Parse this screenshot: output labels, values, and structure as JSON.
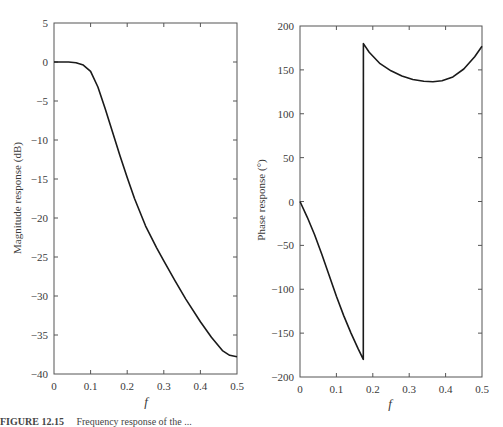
{
  "chart_data": [
    {
      "type": "line",
      "title": "",
      "xlabel": "f",
      "ylabel": "Magnitude response (dB)",
      "xlim": [
        0,
        0.5
      ],
      "ylim": [
        -40,
        5
      ],
      "xticks": [
        0,
        0.1,
        0.2,
        0.3,
        0.4,
        0.5
      ],
      "yticks": [
        5,
        0,
        -5,
        -10,
        -15,
        -20,
        -25,
        -30,
        -35,
        -40
      ],
      "grid": false,
      "legend": null,
      "series": [
        {
          "name": "magnitude",
          "x": [
            0,
            0.02,
            0.04,
            0.06,
            0.08,
            0.1,
            0.12,
            0.14,
            0.16,
            0.18,
            0.2,
            0.22,
            0.25,
            0.28,
            0.3,
            0.33,
            0.36,
            0.4,
            0.43,
            0.46,
            0.48,
            0.5
          ],
          "y": [
            0,
            0,
            0,
            -0.1,
            -0.4,
            -1.2,
            -3.2,
            -6.0,
            -9.0,
            -12.0,
            -14.8,
            -17.5,
            -21.0,
            -23.8,
            -25.5,
            -28.0,
            -30.4,
            -33.3,
            -35.3,
            -37.0,
            -37.6,
            -37.8
          ]
        }
      ]
    },
    {
      "type": "line",
      "title": "",
      "xlabel": "f",
      "ylabel": "Phase response (°)",
      "xlim": [
        0,
        0.5
      ],
      "ylim": [
        -200,
        200
      ],
      "xticks": [
        0,
        0.1,
        0.2,
        0.3,
        0.4,
        0.5
      ],
      "yticks": [
        200,
        150,
        100,
        50,
        0,
        -50,
        -100,
        -150,
        -200
      ],
      "grid": false,
      "legend": null,
      "series": [
        {
          "name": "phase",
          "x": [
            0,
            0.02,
            0.04,
            0.06,
            0.08,
            0.1,
            0.12,
            0.14,
            0.16,
            0.174,
            0.1741,
            0.19,
            0.22,
            0.25,
            0.28,
            0.31,
            0.34,
            0.365,
            0.39,
            0.42,
            0.45,
            0.48,
            0.5
          ],
          "y": [
            0,
            -18,
            -38,
            -60,
            -84,
            -108,
            -130,
            -150,
            -168,
            -180,
            180,
            170,
            157,
            149,
            143,
            139,
            137,
            136.5,
            137.5,
            142,
            151,
            165,
            177
          ]
        }
      ]
    }
  ],
  "figure": {
    "left": {
      "ylabel": "Magnitude response (dB)",
      "xlabel": "f",
      "xtick_labels": [
        "0",
        "0.1",
        "0.2",
        "0.3",
        "0.4",
        "0.5"
      ],
      "ytick_labels": [
        "5",
        "0",
        "−5",
        "−10",
        "−15",
        "−20",
        "−25",
        "−30",
        "−35",
        "−40"
      ]
    },
    "right": {
      "ylabel": "Phase response (°)",
      "xlabel": "f",
      "xtick_labels": [
        "0",
        "0.1",
        "0.2",
        "0.3",
        "0.4",
        "0.5"
      ],
      "ytick_labels": [
        "200",
        "150",
        "100",
        "50",
        "0",
        "−50",
        "−100",
        "−150",
        "−200"
      ]
    },
    "caption": {
      "label": "FIGURE 12.15",
      "text": "Frequency response of the ..."
    }
  }
}
